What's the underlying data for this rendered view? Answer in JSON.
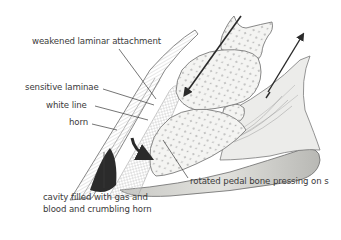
{
  "diagram": {
    "labels": {
      "weakened_laminar": "weakened laminar attachment",
      "sensitive_laminae": "sensitive laminae",
      "white_line": "white line",
      "horn": "horn",
      "cavity_line1": "cavity filled with gas and",
      "cavity_line2": "blood and crumbling horn",
      "pedal_bone": "rotated pedal bone pressing on s"
    },
    "colors": {
      "line": "#3a3a3a",
      "bone_fill": "#f4f4f2",
      "bone_dots": "#9a9a9a",
      "sole_fill": "#d6d6d2",
      "arrow": "#2a2a2a",
      "cavity": "#2b2b2b"
    }
  }
}
